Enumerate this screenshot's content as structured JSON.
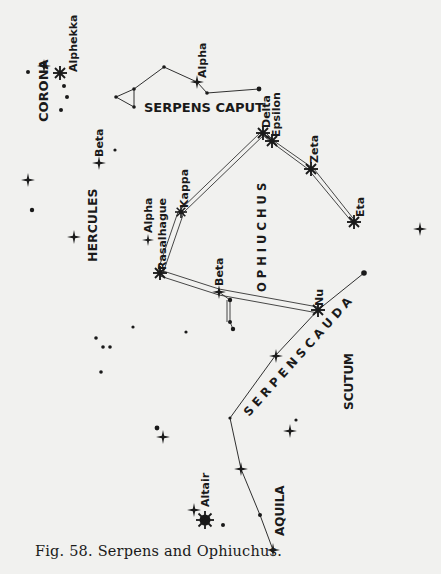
{
  "figure": {
    "caption": "Fig. 58. Serpens and Ophiuchus.",
    "background": "#f1f1ef",
    "ink": "#1a1a1a"
  },
  "constellations": {
    "corona": "CORONA",
    "serpens_caput": "SERPENS CAPUT",
    "hercules": "HERCULES",
    "ophiuchus": "O P H I U C H U S",
    "serpens_cauda": "S E R P E N S  C A U D A",
    "scutum": "SCUTUM",
    "aquila": "AQUILA"
  },
  "stars": {
    "alphekka": "Alphekka",
    "caput_alpha": "Alpha",
    "delta": "Delta",
    "epsilon": "Epsilon",
    "zeta": "Zeta",
    "eta": "Eta",
    "kappa": "Kappa",
    "hercules_beta": "Beta",
    "hercules_alpha": "Alpha",
    "rasalhague": "Rasalhague",
    "oph_beta": "Beta",
    "nu": "Nu",
    "altair": "Altair"
  }
}
